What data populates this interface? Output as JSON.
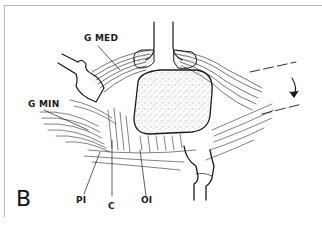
{
  "figure": {
    "panel_letter": "B",
    "labels": {
      "g_med": "G MED",
      "g_min": "G MIN",
      "pi": "PI",
      "c": "C",
      "oi": "OI"
    },
    "colors": {
      "ink": "#1a1a1a",
      "paper": "#ffffff",
      "border": "#b8b8b8"
    }
  }
}
